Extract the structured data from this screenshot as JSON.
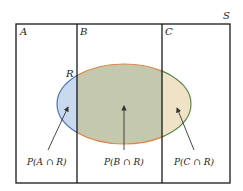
{
  "diagram": {
    "type": "venn-partition",
    "sample_space_label": "S",
    "partitions": [
      {
        "label": "A",
        "intersection_label": "P(A ∩ R)",
        "fill": "#c9daee"
      },
      {
        "label": "B",
        "intersection_label": "P(B ∩ R)",
        "fill": "#c4c8ad"
      },
      {
        "label": "C",
        "intersection_label": "P(C ∩ R)",
        "fill": "#efe2c6"
      }
    ],
    "event_label": "R",
    "colors": {
      "border": "#1a1a1a",
      "ellipse_stroke_left": "#4f74b8",
      "ellipse_stroke_middle": "#d98a4a",
      "ellipse_stroke_right": "#5a8a4e",
      "arrow": "#333333"
    }
  }
}
